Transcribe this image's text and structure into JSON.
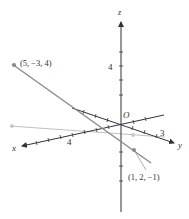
{
  "diagram": {
    "type": "3d-coordinate-axes-with-lines",
    "axes": {
      "x": {
        "label": "x",
        "tick_label": "4"
      },
      "y": {
        "label": "y",
        "tick_label": "3"
      },
      "z": {
        "label": "z",
        "tick_label": "4"
      },
      "origin_label": "O"
    },
    "points": [
      {
        "label": "(5, −3, 4)"
      },
      {
        "label": "(1, 2, −1)"
      }
    ],
    "colors": {
      "axis": "#333333",
      "line_dark": "#777777",
      "line_light": "#b8b8b8",
      "point": "#8a8a8a"
    }
  }
}
